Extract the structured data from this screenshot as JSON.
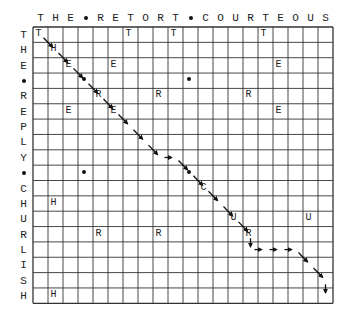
{
  "diagram": {
    "type": "dot-plot alignment grid",
    "column_sequence": [
      "T",
      "H",
      "E",
      "•",
      "R",
      "E",
      "T",
      "O",
      "R",
      "T",
      "•",
      "C",
      "O",
      "U",
      "R",
      "T",
      "E",
      "O",
      "U",
      "S"
    ],
    "row_sequence": [
      "T",
      "H",
      "E",
      "•",
      "R",
      "E",
      "P",
      "L",
      "Y",
      "•",
      "C",
      "H",
      "U",
      "R",
      "L",
      "I",
      "S",
      "H"
    ],
    "column_text": "THE•RETORT•COURTEOUS",
    "row_text": "THE•REPLY•CHURLISH",
    "grid": {
      "left": 33,
      "top": 27,
      "cell_w": 15,
      "cell_h": 15.35,
      "cols": 20,
      "rows": 18
    },
    "matches": [
      {
        "r": 0,
        "c": 0,
        "ch": "T"
      },
      {
        "r": 0,
        "c": 6,
        "ch": "T"
      },
      {
        "r": 0,
        "c": 9,
        "ch": "T"
      },
      {
        "r": 0,
        "c": 15,
        "ch": "T"
      },
      {
        "r": 1,
        "c": 1,
        "ch": "H"
      },
      {
        "r": 2,
        "c": 2,
        "ch": "E"
      },
      {
        "r": 2,
        "c": 5,
        "ch": "E"
      },
      {
        "r": 2,
        "c": 16,
        "ch": "E"
      },
      {
        "r": 3,
        "c": 3,
        "ch": "•"
      },
      {
        "r": 3,
        "c": 10,
        "ch": "•"
      },
      {
        "r": 4,
        "c": 4,
        "ch": "R"
      },
      {
        "r": 4,
        "c": 8,
        "ch": "R"
      },
      {
        "r": 4,
        "c": 14,
        "ch": "R"
      },
      {
        "r": 5,
        "c": 2,
        "ch": "E"
      },
      {
        "r": 5,
        "c": 5,
        "ch": "E"
      },
      {
        "r": 5,
        "c": 16,
        "ch": "E"
      },
      {
        "r": 9,
        "c": 3,
        "ch": "•"
      },
      {
        "r": 9,
        "c": 10,
        "ch": "•"
      },
      {
        "r": 10,
        "c": 11,
        "ch": "C"
      },
      {
        "r": 11,
        "c": 1,
        "ch": "H"
      },
      {
        "r": 12,
        "c": 13,
        "ch": "U"
      },
      {
        "r": 12,
        "c": 18,
        "ch": "U"
      },
      {
        "r": 13,
        "c": 4,
        "ch": "R"
      },
      {
        "r": 13,
        "c": 8,
        "ch": "R"
      },
      {
        "r": 13,
        "c": 14,
        "ch": "R"
      },
      {
        "r": 17,
        "c": 1,
        "ch": "H"
      }
    ],
    "path_arrows": [
      {
        "from": [
          0,
          0
        ],
        "dir": "diag"
      },
      {
        "from": [
          1,
          1
        ],
        "dir": "diag"
      },
      {
        "from": [
          2,
          2
        ],
        "dir": "diag"
      },
      {
        "from": [
          3,
          3
        ],
        "dir": "diag"
      },
      {
        "from": [
          4,
          4
        ],
        "dir": "diag"
      },
      {
        "from": [
          5,
          5
        ],
        "dir": "diag"
      },
      {
        "from": [
          6,
          6
        ],
        "dir": "diag"
      },
      {
        "from": [
          7,
          7
        ],
        "dir": "diag"
      },
      {
        "from": [
          8,
          8
        ],
        "dir": "right"
      },
      {
        "from": [
          8,
          9
        ],
        "dir": "diag"
      },
      {
        "from": [
          9,
          10
        ],
        "dir": "diag"
      },
      {
        "from": [
          10,
          11
        ],
        "dir": "diag"
      },
      {
        "from": [
          11,
          12
        ],
        "dir": "diag"
      },
      {
        "from": [
          12,
          13
        ],
        "dir": "diag"
      },
      {
        "from": [
          13,
          14
        ],
        "dir": "down"
      },
      {
        "from": [
          14,
          14
        ],
        "dir": "right"
      },
      {
        "from": [
          14,
          15
        ],
        "dir": "right"
      },
      {
        "from": [
          14,
          16
        ],
        "dir": "right"
      },
      {
        "from": [
          14,
          17
        ],
        "dir": "diag"
      },
      {
        "from": [
          15,
          18
        ],
        "dir": "diag"
      },
      {
        "from": [
          16,
          19
        ],
        "dir": "down"
      }
    ],
    "colors": {
      "line": "#333333",
      "text": "#222222",
      "background": "#ffffff"
    }
  }
}
